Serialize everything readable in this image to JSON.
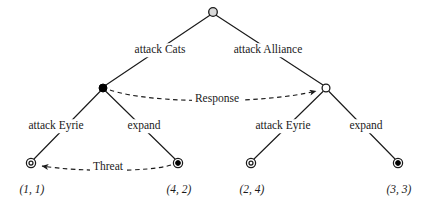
{
  "diagram": {
    "type": "extensive-form-game-tree",
    "title": "",
    "colors": {
      "line": "#1a1a1a",
      "text": "#1a1a1a",
      "node_open_fill": "#d9d9d9",
      "node_filled": "#000000",
      "node_hollow_fill": "#ffffff",
      "background": "#ffffff"
    },
    "nodes": [
      {
        "id": "root",
        "x": 213,
        "y": 12,
        "style": "open-circle",
        "r": 4.6,
        "label": ""
      },
      {
        "id": "left",
        "x": 103,
        "y": 88,
        "style": "filled-circle",
        "r": 4.2,
        "label": ""
      },
      {
        "id": "right",
        "x": 326,
        "y": 88,
        "style": "hollow-circle",
        "r": 4.2,
        "label": ""
      },
      {
        "id": "t1",
        "x": 31,
        "y": 163,
        "style": "double-circle",
        "r": 4.6,
        "label": "(1, 1)"
      },
      {
        "id": "t2",
        "x": 178,
        "y": 163,
        "style": "bullseye",
        "r": 4.6,
        "label": "(4, 2)"
      },
      {
        "id": "t3",
        "x": 251,
        "y": 163,
        "style": "double-circle",
        "r": 4.6,
        "label": "(2, 4)"
      },
      {
        "id": "t4",
        "x": 398,
        "y": 163,
        "style": "bullseye",
        "r": 4.6,
        "label": "(3, 3)"
      }
    ],
    "edges": [
      {
        "id": "root-left",
        "from": "root",
        "to": "left",
        "label": "attack Cats",
        "label_x": 160,
        "label_y": 50
      },
      {
        "id": "root-right",
        "from": "root",
        "to": "right",
        "label": "attack Alliance",
        "label_x": 268,
        "label_y": 50
      },
      {
        "id": "left-t1",
        "from": "left",
        "to": "t1",
        "label": "attack Eyrie",
        "label_x": 56,
        "label_y": 126
      },
      {
        "id": "left-t2",
        "from": "left",
        "to": "t2",
        "label": "expand",
        "label_x": 144,
        "label_y": 126
      },
      {
        "id": "right-t3",
        "from": "right",
        "to": "t3",
        "label": "attack Eyrie",
        "label_x": 283,
        "label_y": 126
      },
      {
        "id": "right-t4",
        "from": "right",
        "to": "t4",
        "label": "expand",
        "label_x": 366,
        "label_y": 126
      }
    ],
    "annotations": [
      {
        "id": "response-arrow",
        "label": "Response",
        "label_x": 217,
        "label_y": 99,
        "style": "dashed-curved-arrow",
        "from_node": "left",
        "to_node": "right",
        "direction": "left-to-right"
      },
      {
        "id": "threat-arrow",
        "label": "Threat",
        "label_x": 108,
        "label_y": 167,
        "style": "dashed-curved-arrow",
        "from_node": "t2",
        "to_node": "t1",
        "direction": "right-to-left"
      }
    ],
    "payoffs": [
      {
        "node": "t1",
        "value": "(1, 1)",
        "x": 32,
        "y": 190
      },
      {
        "node": "t2",
        "value": "(4, 2)",
        "x": 179,
        "y": 190
      },
      {
        "node": "t3",
        "value": "(2, 4)",
        "x": 252,
        "y": 190
      },
      {
        "node": "t4",
        "value": "(3, 3)",
        "x": 399,
        "y": 190
      }
    ]
  }
}
